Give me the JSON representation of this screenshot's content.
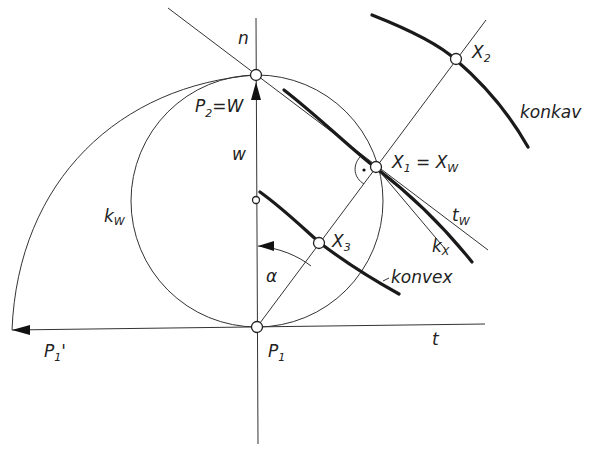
{
  "diagram": {
    "labels": {
      "n": "n",
      "p2": "P",
      "p2_sub": "2",
      "p2_eq": "=W",
      "w": "w",
      "kw": "k",
      "kw_sub": "W",
      "alpha": "α",
      "p1": "P",
      "p1_sub": "1",
      "p1prime": "P",
      "p1prime_sub": "1",
      "p1prime_mark": "'",
      "t": "t",
      "x1": "X",
      "x1_sub": "1",
      "x1_eq": " = X",
      "x1_eq_sub": "W",
      "x2": "X",
      "x2_sub": "2",
      "x3": "X",
      "x3_sub": "3",
      "tw": "t",
      "tw_sub": "W",
      "kx": "k",
      "kx_sub": "X",
      "konkav": "konkav",
      "konvex": "konvex"
    },
    "colors": {
      "line": "#333333",
      "background": "#ffffff"
    }
  }
}
